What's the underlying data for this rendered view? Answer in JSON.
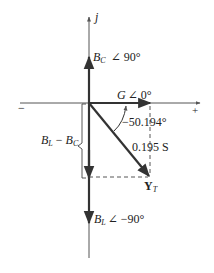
{
  "diagram": {
    "type": "admittance phasor diagram",
    "axes": {
      "vertical_label": "j",
      "negative_label": "−",
      "positive_label": "+"
    },
    "vectors": {
      "bc": {
        "symbol": "B",
        "subscript": "C",
        "angle": "∠ 90°"
      },
      "g": {
        "symbol": "G",
        "angle": "∠ 0°"
      },
      "bl": {
        "symbol": "B",
        "subscript": "L",
        "angle": "∠ −90°"
      },
      "yt": {
        "symbol": "Y",
        "subscript": "T",
        "magnitude": "0.195 S"
      }
    },
    "annotations": {
      "angle": "−50.194°",
      "difference": {
        "a": "B",
        "a_sub": "L",
        "minus": " − ",
        "b": "B",
        "b_sub": "C"
      }
    },
    "colors": {
      "axis": "#555555",
      "vector": "#333333",
      "dashed": "#444444"
    }
  }
}
